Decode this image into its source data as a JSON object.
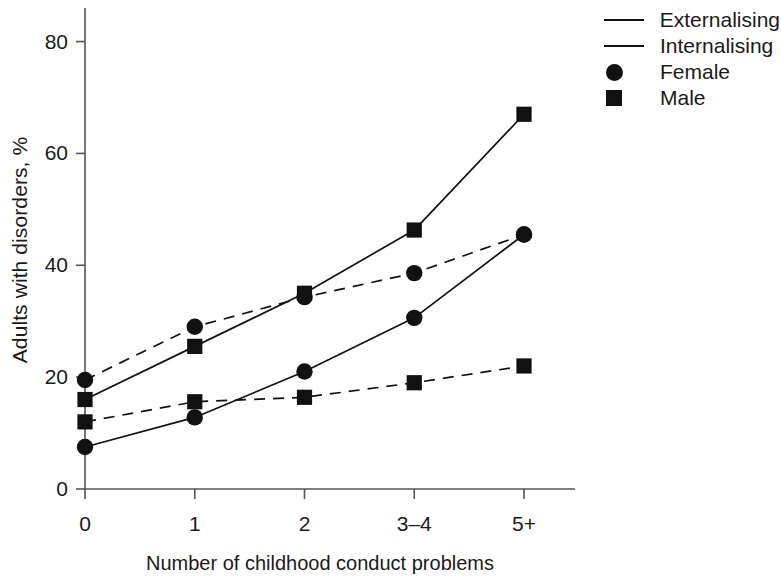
{
  "chart_data": {
    "type": "line",
    "title": "",
    "xlabel": "Number of childhood conduct problems",
    "ylabel": "Adults with disorders, %",
    "categories": [
      "0",
      "1",
      "2",
      "3–4",
      "5+"
    ],
    "xtick_labels": [
      "0",
      "1",
      "2",
      "3–4",
      "5+"
    ],
    "ytick_labels": [
      "0",
      "20",
      "40",
      "60",
      "80"
    ],
    "yticks": [
      0,
      20,
      40,
      60,
      80
    ],
    "ylim": [
      0,
      86
    ],
    "grid": false,
    "legend_position": "top-right",
    "series": [
      {
        "name": "Male externalising",
        "disorder": "Externalising",
        "sex": "Male",
        "marker": "square",
        "line_style": "solid",
        "values": [
          16,
          25.5,
          35,
          46.3,
          67
        ]
      },
      {
        "name": "Female internalising",
        "disorder": "Internalising",
        "sex": "Female",
        "marker": "circle",
        "line_style": "dashed",
        "values": [
          19.5,
          29,
          34.3,
          38.6,
          45.5
        ]
      },
      {
        "name": "Female externalising",
        "disorder": "Externalising",
        "sex": "Female",
        "marker": "circle",
        "line_style": "solid",
        "values": [
          7.5,
          12.8,
          21,
          30.6,
          45.5
        ]
      },
      {
        "name": "Male internalising",
        "disorder": "Internalising",
        "sex": "Male",
        "marker": "square",
        "line_style": "dashed",
        "values": [
          12,
          15.6,
          16.4,
          19,
          22
        ]
      }
    ],
    "legend": [
      {
        "label": "Externalising",
        "key": "line-solid"
      },
      {
        "label": "Internalising",
        "key": "line-solid"
      },
      {
        "label": "Female",
        "key": "circle-marker"
      },
      {
        "label": "Male",
        "key": "square-marker"
      }
    ],
    "colors": {
      "line": "#111111",
      "marker": "#111111",
      "axis": "#555555",
      "background": "#ffffff"
    }
  }
}
